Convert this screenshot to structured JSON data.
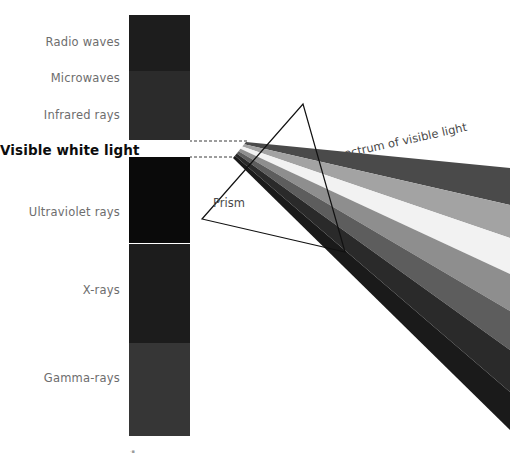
{
  "background": "#ffffff",
  "em_bar": {
    "name": "electromagnetic-spectrum-bar",
    "x": 129,
    "y": 15,
    "width": 61,
    "height": 421,
    "segments": [
      {
        "key": "radio",
        "label": "Radio waves",
        "color": "#1d1d1d",
        "top": 15,
        "height": 56
      },
      {
        "key": "microwave",
        "label": "Microwaves",
        "color": "#2b2b2b",
        "top": 71,
        "height": 36
      },
      {
        "key": "infrared",
        "label": "Infrared rays",
        "color": "#2b2b2b",
        "top": 107,
        "height": 33
      },
      {
        "key": "visible",
        "label": "Visible white light",
        "color": "#ffffff",
        "top": 140,
        "height": 17
      },
      {
        "key": "ultraviolet",
        "label": "Ultraviolet rays",
        "color": "#0a0a0a",
        "top": 157,
        "height": 86
      },
      {
        "key": "xray",
        "label": "X-rays",
        "color": "#1c1c1c",
        "top": 244,
        "height": 99
      },
      {
        "key": "gamma",
        "label": "Gamma-rays",
        "color": "#363636",
        "top": 343,
        "height": 93
      }
    ]
  },
  "labels": [
    {
      "key": "radio",
      "text": "Radio waves",
      "right": 120,
      "top": 35,
      "bold": false
    },
    {
      "key": "microwave",
      "text": "Microwaves",
      "right": 120,
      "top": 71,
      "bold": false
    },
    {
      "key": "infrared",
      "text": "Infrared rays",
      "right": 120,
      "top": 108,
      "bold": false
    },
    {
      "key": "visible",
      "text": "Visible white light",
      "right": 120,
      "top": 142,
      "bold": true
    },
    {
      "key": "ultraviolet",
      "text": "Ultraviolet rays",
      "right": 120,
      "top": 205,
      "bold": false
    },
    {
      "key": "xray",
      "text": "X-rays",
      "right": 120,
      "top": 283,
      "bold": false
    },
    {
      "key": "gamma",
      "text": "Gamma-rays",
      "right": 120,
      "top": 371,
      "bold": false
    }
  ],
  "prism": {
    "name": "prism",
    "label": "Prism",
    "label_left": 213,
    "label_top": 196,
    "apex": {
      "x": 303,
      "y": 104
    },
    "bottom_left": {
      "x": 202,
      "y": 219
    },
    "bottom_right": {
      "x": 345,
      "y": 252
    },
    "stroke": "#111111",
    "stroke_width": 1.2
  },
  "incoming_beam": {
    "name": "incident-white-light-beam",
    "style": "dashed",
    "color": "#3a3a3a",
    "dash": "3 2",
    "top_line": {
      "x1": 129,
      "y1": 141,
      "x2": 247,
      "y2": 141
    },
    "bottom_line": {
      "x1": 129,
      "y1": 157,
      "x2": 232,
      "y2": 157
    }
  },
  "spectrum_caption": {
    "text": "Spectrum of visible light",
    "left": 330,
    "top": 150,
    "rotation_deg": -12.5
  },
  "dispersed_bands": {
    "name": "dispersed-spectrum-bands",
    "origin_top": {
      "x": 246,
      "y": 142
    },
    "origin_bottom": {
      "x": 233,
      "y": 158
    },
    "right_edge_x": 510,
    "note": "grayscale rendition of the visible spectrum fanning out from the prism",
    "bands": [
      {
        "key": "band-1",
        "color": "#4a4a4a",
        "far_top": 168,
        "far_bottom": 205
      },
      {
        "key": "band-2",
        "color": "#a3a3a3",
        "far_top": 205,
        "far_bottom": 238
      },
      {
        "key": "band-3",
        "color": "#f2f2f2",
        "far_top": 238,
        "far_bottom": 274
      },
      {
        "key": "band-4",
        "color": "#8e8e8e",
        "far_top": 274,
        "far_bottom": 311
      },
      {
        "key": "band-5",
        "color": "#5d5d5d",
        "far_top": 311,
        "far_bottom": 350
      },
      {
        "key": "band-6",
        "color": "#2a2a2a",
        "far_top": 350,
        "far_bottom": 392
      },
      {
        "key": "band-7",
        "color": "#1a1a1a",
        "far_top": 392,
        "far_bottom": 430
      }
    ]
  },
  "footer_mark": {
    "text": "·▪",
    "left": 130,
    "top": 448
  },
  "colors": {
    "ink": "#111111",
    "label_gray": "#6d6d6d",
    "label_black": "#0d0d0d",
    "caption_gray": "#4a4a4a"
  }
}
